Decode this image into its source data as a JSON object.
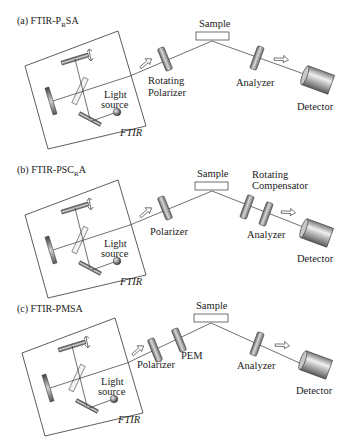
{
  "figure": {
    "panels": [
      {
        "id": "a",
        "title_prefix": "(a) FTIR-P",
        "title_sub": "R",
        "title_suffix": "SA",
        "ftir_label": "FTIR",
        "light_source_line1": "Light",
        "light_source_line2": "source",
        "sample_label": "Sample",
        "elements_before_sample": [
          {
            "label_line1": "Rotating",
            "label_line2": "Polarizer"
          }
        ],
        "elements_after_sample": [
          {
            "label_line1": "Analyzer",
            "label_line2": ""
          }
        ],
        "detector_label": "Detector"
      },
      {
        "id": "b",
        "title_prefix": "(b) FTIR-PSC",
        "title_sub": "R",
        "title_suffix": "A",
        "ftir_label": "FTIR",
        "light_source_line1": "Light",
        "light_source_line2": "source",
        "sample_label": "Sample",
        "elements_before_sample": [
          {
            "label_line1": "Polarizer",
            "label_line2": ""
          }
        ],
        "elements_after_sample": [
          {
            "label_line1": "Rotating",
            "label_line2": "Compensator"
          },
          {
            "label_line1": "Analyzer",
            "label_line2": ""
          }
        ],
        "detector_label": "Detector"
      },
      {
        "id": "c",
        "title_prefix": "(c) FTIR-PMSA",
        "title_sub": "",
        "title_suffix": "",
        "ftir_label": "FTIR",
        "light_source_line1": "Light",
        "light_source_line2": "source",
        "sample_label": "Sample",
        "elements_before_sample": [
          {
            "label_line1": "Polarizer",
            "label_line2": ""
          },
          {
            "label_line1": "PEM",
            "label_line2": ""
          }
        ],
        "elements_after_sample": [
          {
            "label_line1": "Analyzer",
            "label_line2": ""
          }
        ],
        "detector_label": "Detector"
      }
    ]
  },
  "colors": {
    "line": "#333333",
    "optic_dark": "#555555",
    "optic_light": "#e0e0e0",
    "background": "#ffffff"
  }
}
